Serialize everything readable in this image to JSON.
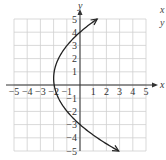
{
  "chart_data": {
    "type": "line",
    "title": "",
    "xlabel": "x",
    "ylabel": "y",
    "xlim": [
      -5,
      5
    ],
    "ylim": [
      -5,
      5
    ],
    "grid": true,
    "x_ticks": [
      "-5",
      "-4",
      "-3",
      "-2",
      "-1",
      "1",
      "2",
      "3",
      "4",
      "5"
    ],
    "y_ticks": [
      "5",
      "4",
      "3",
      "2",
      "1",
      "-1",
      "-2",
      "-3",
      "-4",
      "-5"
    ],
    "series": [
      {
        "name": "parabola opening right",
        "description": "x = a(y-4)(y+3), vertex near (-2, 0.5), arrows at both ends",
        "points": [
          {
            "x": 1.3,
            "y": 5
          },
          {
            "x": 0,
            "y": 4
          },
          {
            "x": -1.0,
            "y": 3
          },
          {
            "x": -1.6,
            "y": 2
          },
          {
            "x": -1.95,
            "y": 1
          },
          {
            "x": -2.0,
            "y": 0.5
          },
          {
            "x": -1.95,
            "y": 0
          },
          {
            "x": -1.6,
            "y": -1
          },
          {
            "x": -1.0,
            "y": -2
          },
          {
            "x": 0,
            "y": -3
          },
          {
            "x": 1.3,
            "y": -4
          },
          {
            "x": 2.9,
            "y": -5
          }
        ]
      }
    ]
  },
  "side_labels": {
    "x": "x",
    "y": "y"
  }
}
